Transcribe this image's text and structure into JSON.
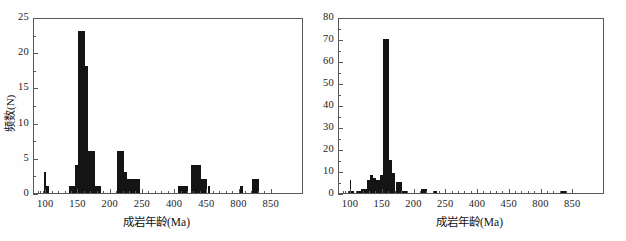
{
  "figure": {
    "background_color": "#ffffff",
    "bar_color": "#141414",
    "axis_color": "#555a55"
  },
  "panels": [
    {
      "id": "left",
      "axis_title_x": "成岩年龄(Ma)",
      "axis_title_y": "频数(N)"
    },
    {
      "id": "right",
      "axis_title_x": "成岩年龄(Ma)",
      "axis_title_y": ""
    }
  ],
  "chart_data": [
    {
      "type": "bar",
      "title": "",
      "panel": "left",
      "xlabel": "成岩年龄(Ma)",
      "ylabel": "频数(N)",
      "xlim": [
        80,
        850
      ],
      "ylim": [
        0,
        25
      ],
      "grid": false,
      "legend": null,
      "note": "Broken / compressed x-axis: equally spaced labels at 100,150,200,250,400,450,800,850",
      "xticks": [
        100,
        150,
        200,
        250,
        400,
        450,
        800,
        850
      ],
      "xtick_labels": [
        "100",
        "150",
        "200",
        "250",
        "400",
        "450",
        "800",
        "850"
      ],
      "yticks": [
        0,
        5,
        10,
        15,
        20,
        25
      ],
      "ytick_labels": [
        "0",
        "5",
        "10",
        "15",
        "20",
        "25"
      ],
      "bin_width": 5,
      "bins": [
        {
          "x": 90,
          "value": 3
        },
        {
          "x": 95,
          "value": 3
        },
        {
          "x": 100,
          "value": 1
        },
        {
          "x": 135,
          "value": 1
        },
        {
          "x": 140,
          "value": 1
        },
        {
          "x": 145,
          "value": 4
        },
        {
          "x": 150,
          "value": 23
        },
        {
          "x": 155,
          "value": 23
        },
        {
          "x": 160,
          "value": 18
        },
        {
          "x": 165,
          "value": 6
        },
        {
          "x": 170,
          "value": 6
        },
        {
          "x": 175,
          "value": 1
        },
        {
          "x": 180,
          "value": 1
        },
        {
          "x": 210,
          "value": 6
        },
        {
          "x": 215,
          "value": 6
        },
        {
          "x": 220,
          "value": 3
        },
        {
          "x": 225,
          "value": 2
        },
        {
          "x": 230,
          "value": 2
        },
        {
          "x": 235,
          "value": 2
        },
        {
          "x": 240,
          "value": 2
        },
        {
          "x": 405,
          "value": 1
        },
        {
          "x": 410,
          "value": 1
        },
        {
          "x": 415,
          "value": 1
        },
        {
          "x": 425,
          "value": 4
        },
        {
          "x": 430,
          "value": 4
        },
        {
          "x": 435,
          "value": 4
        },
        {
          "x": 440,
          "value": 2
        },
        {
          "x": 445,
          "value": 2
        },
        {
          "x": 460,
          "value": 1
        },
        {
          "x": 465,
          "value": 1
        },
        {
          "x": 800,
          "value": 1
        },
        {
          "x": 820,
          "value": 2
        },
        {
          "x": 825,
          "value": 2
        }
      ]
    },
    {
      "type": "bar",
      "title": "",
      "panel": "right",
      "xlabel": "成岩年龄(Ma)",
      "ylabel": "",
      "xlim": [
        80,
        850
      ],
      "ylim": [
        0,
        80
      ],
      "grid": false,
      "legend": null,
      "note": "Broken / compressed x-axis: equally spaced labels at 100,150,200,250,400,450,800,850",
      "xticks": [
        100,
        150,
        200,
        250,
        400,
        450,
        800,
        850
      ],
      "xtick_labels": [
        "100",
        "150",
        "200",
        "250",
        "400",
        "450",
        "800",
        "850"
      ],
      "yticks": [
        0,
        10,
        20,
        30,
        40,
        50,
        60,
        70,
        80
      ],
      "ytick_labels": [
        "0",
        "10",
        "20",
        "30",
        "40",
        "50",
        "60",
        "70",
        "80"
      ],
      "bin_width": 5,
      "bins": [
        {
          "x": 90,
          "value": 1
        },
        {
          "x": 95,
          "value": 6
        },
        {
          "x": 100,
          "value": 1
        },
        {
          "x": 110,
          "value": 1
        },
        {
          "x": 115,
          "value": 2
        },
        {
          "x": 120,
          "value": 2
        },
        {
          "x": 125,
          "value": 6
        },
        {
          "x": 130,
          "value": 8
        },
        {
          "x": 135,
          "value": 7
        },
        {
          "x": 140,
          "value": 6
        },
        {
          "x": 145,
          "value": 8
        },
        {
          "x": 150,
          "value": 70
        },
        {
          "x": 155,
          "value": 70
        },
        {
          "x": 160,
          "value": 15
        },
        {
          "x": 165,
          "value": 9
        },
        {
          "x": 170,
          "value": 5
        },
        {
          "x": 175,
          "value": 5
        },
        {
          "x": 180,
          "value": 1
        },
        {
          "x": 185,
          "value": 1
        },
        {
          "x": 210,
          "value": 2
        },
        {
          "x": 215,
          "value": 2
        },
        {
          "x": 230,
          "value": 1
        },
        {
          "x": 830,
          "value": 1
        },
        {
          "x": 835,
          "value": 1
        }
      ]
    }
  ]
}
